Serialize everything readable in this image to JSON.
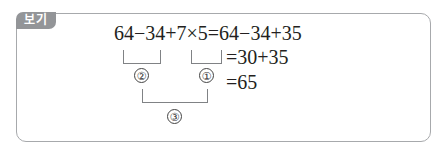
{
  "badge": {
    "label": "보기"
  },
  "equation": {
    "line1": "64−34+7×5=64−34+35",
    "line2": "=30+35",
    "line3": "=65"
  },
  "steps": [
    {
      "label": "①",
      "target": "7×5"
    },
    {
      "label": "②",
      "target": "64−34"
    },
    {
      "label": "③",
      "target": "(64−34)+(7×5)"
    }
  ],
  "colors": {
    "badge_bg": "#939598",
    "border": "#a7a9ac"
  }
}
